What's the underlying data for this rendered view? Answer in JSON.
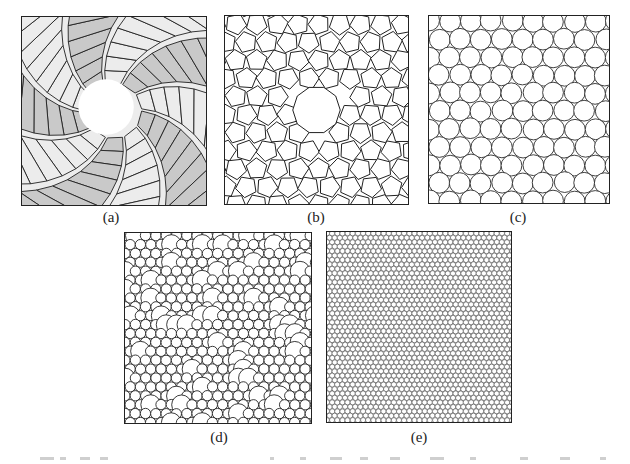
{
  "figure": {
    "panels": [
      {
        "id": "a",
        "label": "(a)",
        "kind": "spiral-rhombus",
        "box": [
          21,
          16,
          186,
          190
        ],
        "label_pos": [
          111,
          219
        ],
        "colors": {
          "light": "#ececec",
          "dark": "#c9c9c9",
          "stroke": "#1e1e1e",
          "hole": "#ffffff"
        },
        "arms": 10,
        "hole_radius": 28
      },
      {
        "id": "b",
        "label": "(b)",
        "kind": "pentagon-rhombus-tiling",
        "box": [
          224,
          15,
          185,
          190
        ],
        "label_pos": [
          316,
          219
        ],
        "colors": {
          "stroke": "#1e1e1e",
          "fill": "#ffffff"
        },
        "hole_radius": 24
      },
      {
        "id": "c",
        "label": "(c)",
        "kind": "circle-packing-coarse",
        "box": [
          428,
          15,
          182,
          189
        ],
        "label_pos": [
          518,
          219
        ],
        "colors": {
          "stroke": "#2a2a2a",
          "fill": "#ffffff"
        },
        "circle_radius": 10.5
      },
      {
        "id": "d",
        "label": "(d)",
        "kind": "circle-packing-medium",
        "box": [
          124,
          232,
          188,
          192
        ],
        "label_pos": [
          219,
          439
        ],
        "colors": {
          "stroke": "#222222",
          "fill": "#ffffff"
        },
        "circle_radius": 5.2
      },
      {
        "id": "e",
        "label": "(e)",
        "kind": "circle-packing-fine",
        "box": [
          326,
          231,
          186,
          192
        ],
        "label_pos": [
          419,
          439
        ],
        "colors": {
          "stroke": "#444444",
          "fill": "#ffffff"
        },
        "circle_radius": 2.6
      }
    ],
    "cropped_caption_fragments": [
      [
        40,
        14
      ],
      [
        60,
        6
      ],
      [
        80,
        10
      ],
      [
        100,
        8
      ],
      [
        270,
        4
      ],
      [
        300,
        6
      ],
      [
        330,
        12
      ],
      [
        360,
        8
      ],
      [
        390,
        10
      ],
      [
        430,
        14
      ],
      [
        470,
        6
      ],
      [
        520,
        8
      ],
      [
        560,
        10
      ],
      [
        600,
        6
      ]
    ]
  }
}
